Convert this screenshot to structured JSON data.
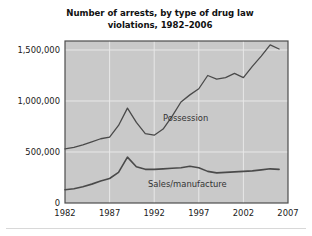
{
  "figure": {
    "title_line1": "Number of arrests, by type of drug law",
    "title_line2": "violations, 1982–2006",
    "background_color": "#ffffff",
    "plot_background_color": "#c9c9c9",
    "plot_border_color": "#4d4d4d",
    "gridline_color": "#e8e8e8",
    "line_color": "#4a4a4a"
  },
  "axes": {
    "y_ticks": [
      "0",
      "500,000",
      "1,000,000",
      "1,500,000"
    ],
    "y_tick_values": [
      0,
      500000,
      1000000,
      1500000
    ],
    "x_ticks": [
      "1982",
      "1987",
      "1992",
      "1997",
      "2002",
      "2007"
    ],
    "x_tick_values": [
      1982,
      1987,
      1992,
      1997,
      2002,
      2007
    ]
  },
  "labels": {
    "possession": "Possession",
    "sales": "Sales/manufacture"
  },
  "chart_data": {
    "type": "line",
    "title": "Number of arrests, by type of drug law violations, 1982–2006",
    "xlabel": "",
    "ylabel": "",
    "xlim": [
      1982,
      2007
    ],
    "ylim": [
      0,
      1600000
    ],
    "grid": true,
    "legend": "inline-annotations",
    "x": [
      1982,
      1983,
      1984,
      1985,
      1986,
      1987,
      1988,
      1989,
      1990,
      1991,
      1992,
      1993,
      1994,
      1995,
      1996,
      1997,
      1998,
      1999,
      2000,
      2001,
      2002,
      2003,
      2004,
      2005,
      2006
    ],
    "series": [
      {
        "name": "Possession",
        "values": [
          530000,
          545000,
          570000,
          600000,
          630000,
          645000,
          760000,
          930000,
          790000,
          680000,
          665000,
          725000,
          850000,
          990000,
          1060000,
          1120000,
          1250000,
          1215000,
          1230000,
          1270000,
          1230000,
          1340000,
          1440000,
          1550000,
          1510000
        ]
      },
      {
        "name": "Sales/manufacture",
        "values": [
          130000,
          140000,
          160000,
          185000,
          215000,
          240000,
          300000,
          450000,
          355000,
          330000,
          330000,
          335000,
          340000,
          345000,
          360000,
          345000,
          310000,
          295000,
          300000,
          305000,
          310000,
          315000,
          325000,
          335000,
          330000
        ]
      }
    ]
  }
}
